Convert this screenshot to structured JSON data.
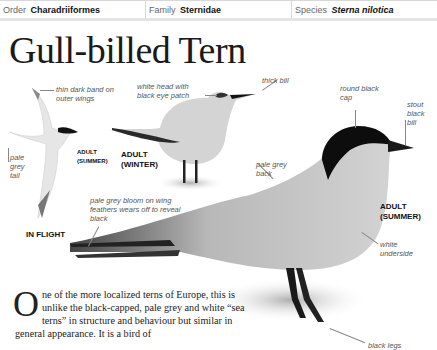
{
  "header": {
    "order_label": "Order",
    "order_value": "Charadriiformes",
    "family_label": "Family",
    "family_value": "Sternidae",
    "species_label": "Species",
    "species_value": "Sterna nilotica"
  },
  "title": "Gull-billed Tern",
  "illustrations": {
    "flight": {
      "caption": "IN FLIGHT",
      "labels": {
        "outer_wings": "thin dark band on outer wings",
        "tail": "pale grey tail",
        "age": "ADULT (SUMMER)"
      }
    },
    "winter": {
      "caption": "ADULT (WINTER)",
      "labels": {
        "head": "white head with black eye patch",
        "bill": "thick bill"
      }
    },
    "summer": {
      "caption": "ADULT (SUMMER)",
      "labels": {
        "cap": "round black cap",
        "bill": "stout black bill",
        "back": "pale grey back",
        "wing": "pale grey bloom on wing feathers wears off to reveal black",
        "underside": "white underside",
        "legs": "black legs"
      }
    }
  },
  "body": {
    "dropcap": "O",
    "text": "ne of the more localized terns of Europe, this is unlike the black-capped, pale grey and white “sea terns” in structure and behaviour but similar in general appearance. It is a bird of"
  }
}
